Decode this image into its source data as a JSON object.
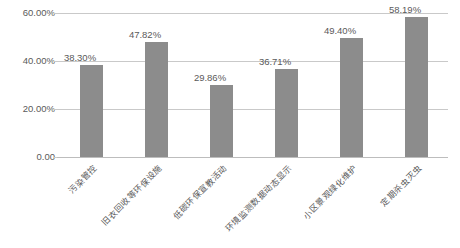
{
  "chart_data": {
    "type": "bar",
    "title": "",
    "xlabel": "",
    "ylabel": "",
    "categories": [
      "污染管控",
      "旧衣回收等环保设施",
      "低碳环保宣教活动",
      "环境监测数据动态显示",
      "小区景观绿化维护",
      "定期杀虫灭虫"
    ],
    "values": [
      38.3,
      47.82,
      29.86,
      36.71,
      49.4,
      58.19
    ],
    "value_labels": [
      "38.30%",
      "47.82%",
      "29.86%",
      "36.71%",
      "49.40%",
      "58.19%"
    ],
    "ylim": [
      0,
      60
    ],
    "yticks": [
      0,
      20,
      40,
      60
    ],
    "ytick_labels": [
      "0.00",
      "20.00%",
      "40.00%",
      "60.00%"
    ],
    "grid": true,
    "legend": "none",
    "bar_color": "#8c8c8c",
    "gridline_color": "#c9c9c9",
    "text_color": "#5a5a5a",
    "background_color": "#ffffff"
  }
}
